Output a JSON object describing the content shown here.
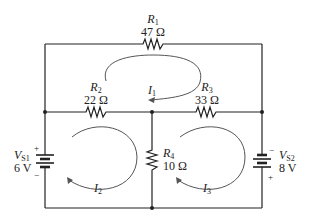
{
  "diagram": {
    "type": "circuit",
    "colors": {
      "wire": "#222222",
      "loop": "#555555",
      "background": "#ffffff"
    },
    "resistors": [
      {
        "id": "R1",
        "name": "R",
        "sub": "1",
        "value": "47 Ω"
      },
      {
        "id": "R2",
        "name": "R",
        "sub": "2",
        "value": "22 Ω"
      },
      {
        "id": "R3",
        "name": "R",
        "sub": "3",
        "value": "33 Ω"
      },
      {
        "id": "R4",
        "name": "R",
        "sub": "4",
        "value": "10 Ω"
      }
    ],
    "sources": [
      {
        "id": "VS1",
        "name": "V",
        "sub": "S1",
        "value": "6 V",
        "plus": "+",
        "minus": "−"
      },
      {
        "id": "VS2",
        "name": "V",
        "sub": "S2",
        "value": "8 V",
        "plus": "+",
        "minus": "−"
      }
    ],
    "loop_currents": [
      {
        "id": "I1",
        "name": "I",
        "sub": "1"
      },
      {
        "id": "I2",
        "name": "I",
        "sub": "2"
      },
      {
        "id": "I3",
        "name": "I",
        "sub": "3"
      }
    ]
  }
}
